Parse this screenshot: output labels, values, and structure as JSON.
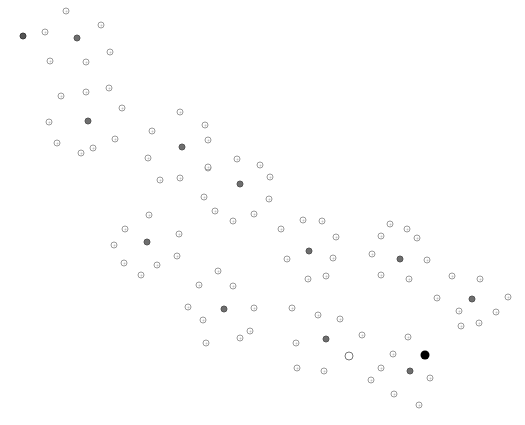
{
  "diagram": {
    "type": "clustered-node-graph",
    "background": "#ffffff",
    "colors": {
      "node_stroke": "#9a9a9a",
      "hub_fill": "#6e6e6e",
      "active_fill": "#000000"
    },
    "clusters": [
      {
        "id": "c1",
        "hub": [
          77,
          38
        ],
        "nodes": [
          [
            66,
            11
          ],
          [
            101,
            25
          ],
          [
            45,
            32
          ],
          [
            110,
            52
          ],
          [
            50,
            61
          ],
          [
            86,
            62
          ]
        ],
        "special": [
          {
            "pos": [
              23,
              36
            ],
            "kind": "dark"
          }
        ]
      },
      {
        "id": "c2",
        "hub": [
          88,
          121
        ],
        "nodes": [
          [
            61,
            96
          ],
          [
            86,
            92
          ],
          [
            109,
            88
          ],
          [
            122,
            108
          ],
          [
            49,
            122
          ],
          [
            57,
            143
          ],
          [
            81,
            153
          ],
          [
            93,
            148
          ],
          [
            115,
            139
          ]
        ]
      },
      {
        "id": "c3",
        "hub": [
          182,
          147
        ],
        "nodes": [
          [
            180,
            112
          ],
          [
            205,
            125
          ],
          [
            152,
            131
          ],
          [
            208,
            140
          ],
          [
            148,
            158
          ],
          [
            180,
            178
          ],
          [
            160,
            180
          ],
          [
            208,
            168
          ]
        ]
      },
      {
        "id": "c4",
        "hub": [
          240,
          184
        ],
        "nodes": [
          [
            237,
            159
          ],
          [
            260,
            165
          ],
          [
            208,
            167
          ],
          [
            270,
            177
          ],
          [
            269,
            199
          ],
          [
            204,
            197
          ],
          [
            215,
            211
          ],
          [
            254,
            214
          ],
          [
            233,
            221
          ]
        ]
      },
      {
        "id": "c5",
        "hub": [
          147,
          242
        ],
        "nodes": [
          [
            149,
            215
          ],
          [
            125,
            229
          ],
          [
            179,
            234
          ],
          [
            114,
            245
          ],
          [
            177,
            256
          ],
          [
            124,
            263
          ],
          [
            157,
            265
          ],
          [
            141,
            275
          ]
        ]
      },
      {
        "id": "c6",
        "hub": [
          224,
          309
        ],
        "nodes": [
          [
            218,
            271
          ],
          [
            199,
            285
          ],
          [
            233,
            286
          ],
          [
            188,
            307
          ],
          [
            254,
            308
          ],
          [
            203,
            320
          ],
          [
            250,
            331
          ],
          [
            240,
            338
          ],
          [
            206,
            343
          ]
        ]
      },
      {
        "id": "c7",
        "hub": [
          309,
          251
        ],
        "nodes": [
          [
            303,
            220
          ],
          [
            322,
            221
          ],
          [
            281,
            229
          ],
          [
            336,
            237
          ],
          [
            287,
            259
          ],
          [
            333,
            258
          ],
          [
            326,
            276
          ],
          [
            308,
            279
          ]
        ]
      },
      {
        "id": "c8",
        "hub": [
          400,
          259
        ],
        "nodes": [
          [
            390,
            224
          ],
          [
            407,
            229
          ],
          [
            381,
            236
          ],
          [
            417,
            238
          ],
          [
            372,
            254
          ],
          [
            427,
            260
          ],
          [
            381,
            275
          ],
          [
            409,
            279
          ]
        ]
      },
      {
        "id": "c9",
        "hub": [
          472,
          299
        ],
        "nodes": [
          [
            452,
            276
          ],
          [
            480,
            279
          ],
          [
            437,
            298
          ],
          [
            508,
            297
          ],
          [
            459,
            311
          ],
          [
            496,
            312
          ],
          [
            461,
            326
          ],
          [
            479,
            323
          ]
        ]
      },
      {
        "id": "c10",
        "hub": [
          326,
          339
        ],
        "nodes": [
          [
            292,
            308
          ],
          [
            318,
            315
          ],
          [
            340,
            319
          ],
          [
            362,
            335
          ],
          [
            296,
            343
          ],
          [
            297,
            368
          ],
          [
            324,
            371
          ]
        ],
        "special": [
          {
            "pos": [
              349,
              356
            ],
            "kind": "ring"
          }
        ]
      },
      {
        "id": "c11",
        "hub": [
          410,
          371
        ],
        "nodes": [
          [
            408,
            337
          ],
          [
            393,
            354
          ],
          [
            381,
            368
          ],
          [
            430,
            378
          ],
          [
            371,
            380
          ],
          [
            394,
            394
          ],
          [
            419,
            405
          ]
        ],
        "special": [
          {
            "pos": [
              425,
              355
            ],
            "kind": "active"
          }
        ]
      }
    ]
  }
}
